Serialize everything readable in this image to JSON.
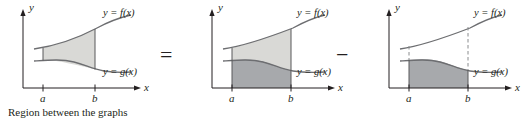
{
  "figure": {
    "caption": "Region between the graphs",
    "operators": {
      "equals": "=",
      "minus": "−"
    },
    "axis_labels": {
      "x": "x",
      "y": "y"
    },
    "tick_labels": {
      "a": "a",
      "b": "b"
    },
    "curve_labels": {
      "f": "y = f(x)",
      "g": "y = g(x)"
    },
    "colors": {
      "ink": "#231f20",
      "curve": "#6d6e71",
      "fill_light": "#d9d9d6",
      "fill_dark": "#a7a9ac",
      "background": "#ffffff"
    },
    "panels": [
      {
        "name": "region-between-graphs",
        "description": "Region between the graphs",
        "shaded": "between f and g from a to b",
        "caption": "Region between the graphs"
      },
      {
        "name": "area-under-f",
        "description": "Area under f from a to b",
        "shaded": "under f from a to b, split by g"
      },
      {
        "name": "area-under-g",
        "description": "Area under g from a to b",
        "shaded": "under g from a to b"
      }
    ]
  }
}
